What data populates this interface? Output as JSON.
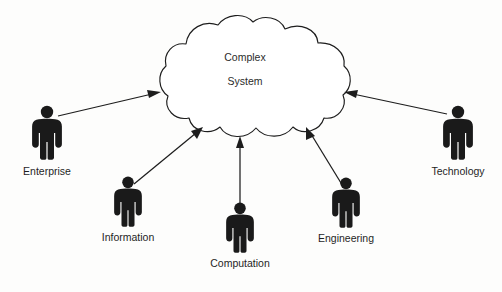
{
  "diagram": {
    "background_color": "#fdfdfc",
    "stroke_color": "#1d1d1d",
    "figure_color": "#1a1a1a",
    "center": {
      "shape": "cloud",
      "line1": "Complex",
      "line2": "System",
      "fill": "#ffffff",
      "cx": 245,
      "cy": 80
    },
    "nodes": [
      {
        "id": "enterprise",
        "label": "Enterprise",
        "icon": "person-icon",
        "figure_x": 47,
        "figure_y": 112,
        "figure_scale": 1.0,
        "label_x": 47,
        "label_y": 172
      },
      {
        "id": "information",
        "label": "Information",
        "icon": "person-icon",
        "figure_x": 128,
        "figure_y": 180,
        "figure_scale": 0.93,
        "label_x": 128,
        "label_y": 238
      },
      {
        "id": "computation",
        "label": "Computation",
        "icon": "person-icon",
        "figure_x": 240,
        "figure_y": 206,
        "figure_scale": 0.93,
        "label_x": 240,
        "label_y": 264
      },
      {
        "id": "engineering",
        "label": "Engineering",
        "icon": "person-icon",
        "figure_x": 346,
        "figure_y": 181,
        "figure_scale": 0.93,
        "label_x": 346,
        "label_y": 238
      },
      {
        "id": "technology",
        "label": "Technology",
        "icon": "person-icon",
        "figure_x": 458,
        "figure_y": 112,
        "figure_scale": 1.0,
        "label_x": 458,
        "label_y": 172
      }
    ],
    "arrows": [
      {
        "id": "enterprise-to-system",
        "from": "enterprise",
        "to": "center",
        "x1": 58,
        "y1": 116,
        "x2": 160,
        "y2": 92
      },
      {
        "id": "information-to-system",
        "from": "information",
        "to": "center",
        "x1": 134,
        "y1": 184,
        "x2": 202,
        "y2": 127
      },
      {
        "id": "computation-to-system",
        "from": "computation",
        "to": "center",
        "x1": 240,
        "y1": 206,
        "x2": 240,
        "y2": 136
      },
      {
        "id": "engineering-to-system",
        "from": "engineering",
        "to": "center",
        "x1": 341,
        "y1": 183,
        "x2": 306,
        "y2": 127
      },
      {
        "id": "technology-to-system",
        "from": "technology",
        "to": "center",
        "x1": 447,
        "y1": 114,
        "x2": 345,
        "y2": 92
      }
    ]
  }
}
